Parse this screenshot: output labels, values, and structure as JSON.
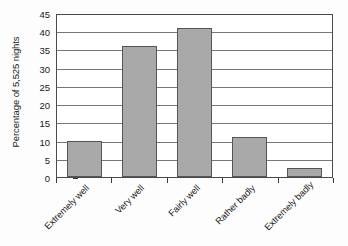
{
  "chart_data": {
    "type": "bar",
    "title": "",
    "subtitle": "",
    "xlabel": "",
    "ylabel": "Percentage of 5,525 nights",
    "categories": [
      "Extremely well",
      "Very well",
      "Fairly well",
      "Rather badly",
      "Extremely badly"
    ],
    "values": [
      10,
      36,
      41,
      11,
      2.5
    ],
    "series": [
      {
        "name": "Percentage of nights",
        "values": [
          10,
          36,
          41,
          11,
          2.5
        ]
      }
    ],
    "ylim": [
      0,
      45
    ],
    "y_ticks": [
      0,
      5,
      10,
      15,
      20,
      25,
      30,
      35,
      40,
      45
    ],
    "y_tick_labels": [
      "0",
      "5",
      "10",
      "15",
      "20",
      "25",
      "30",
      "35",
      "40",
      "45"
    ],
    "grid": "horizontal",
    "legend": "none",
    "legend_position": "none",
    "annotations": [],
    "colors": {
      "bar_fill": "#a9a9a9",
      "bar_stroke": "#555555",
      "gridline": "#777777",
      "axis": "#4a4a4a",
      "background": "#ffffff",
      "text": "#1a1a1a"
    }
  }
}
